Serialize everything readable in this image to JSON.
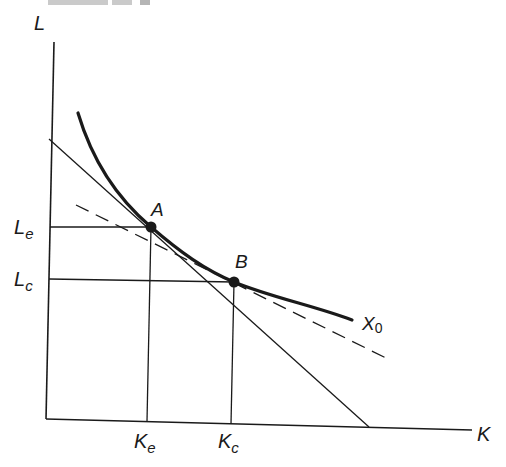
{
  "caption_fragment": "FIGURE 15-3",
  "axes": {
    "y_label": "L",
    "x_label": "K"
  },
  "isoquant": {
    "label_main": "X",
    "label_sub": "0"
  },
  "points": [
    {
      "id": "A",
      "label": "A"
    },
    {
      "id": "B",
      "label": "B"
    }
  ],
  "y_ticks": [
    {
      "main": "L",
      "sub": "e"
    },
    {
      "main": "L",
      "sub": "c"
    }
  ],
  "x_ticks": [
    {
      "main": "K",
      "sub": "e"
    },
    {
      "main": "K",
      "sub": "c"
    }
  ],
  "colors": {
    "ink": "#1a1a1a",
    "background": "#ffffff"
  }
}
